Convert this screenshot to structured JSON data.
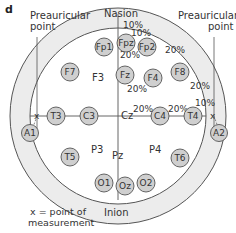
{
  "panel_label": "d",
  "landmarks": {
    "nasion": "Nasion",
    "inion": "Inion",
    "preauricular_left_line1": "Preauricular",
    "preauricular_left_line2": "point",
    "preauricular_right_line1": "Preauricular",
    "preauricular_right_line2": "point"
  },
  "legend": {
    "line1": "x = point of",
    "line2": "measurement"
  },
  "regions": {
    "f3": "F3",
    "p3": "P3",
    "pz": "Pz",
    "p4": "P4",
    "cz": "Cz"
  },
  "electrodes": {
    "fp1": "Fp1",
    "fpz": "Fpz",
    "fp2": "Fp2",
    "f7": "F7",
    "fz": "Fz",
    "f4": "F4",
    "f8": "F8",
    "a1": "A1",
    "t3": "T3",
    "c3": "C3",
    "c4": "C4",
    "t4": "T4",
    "a2": "A2",
    "t5": "T5",
    "t6": "T6",
    "o1": "O1",
    "oz": "Oz",
    "o2": "O2"
  },
  "percentages": {
    "nasion_10": "10%",
    "fpz_10": "10%",
    "fpz_fz_20": "20%",
    "fp2_f8_20": "20%",
    "fz_cz_20": "20%",
    "f8_t4_20": "20%",
    "t4_10": "10%",
    "cz_c4_20": "20%",
    "c4_t4_20": "20%"
  },
  "colors": {
    "electrode_fill": "#cfcfcf",
    "electrode_stroke": "#555555",
    "head_fill": "#ececec",
    "inner_fill": "#ffffff",
    "line": "#555555"
  }
}
